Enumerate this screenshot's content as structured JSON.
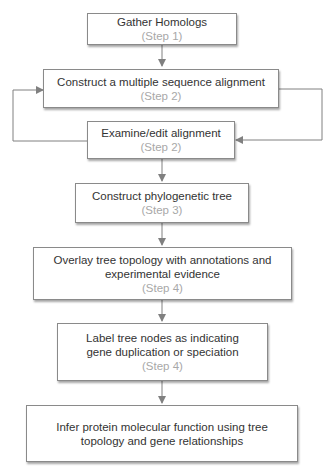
{
  "diagram": {
    "type": "flowchart",
    "colors": {
      "box_border": "#8a8a8a",
      "text": "#333333",
      "step_text": "#a8a8a8",
      "connector": "#808080"
    },
    "nodes": [
      {
        "id": "n1",
        "title": "Gather Homologs",
        "step": "(Step 1)"
      },
      {
        "id": "n2",
        "title": "Construct a multiple sequence alignment",
        "step": "(Step 2)"
      },
      {
        "id": "n3",
        "title": "Examine/edit alignment",
        "step": "(Step 2)"
      },
      {
        "id": "n4",
        "title": "Construct phylogenetic tree",
        "step": "(Step 3)"
      },
      {
        "id": "n5",
        "title": "Overlay tree topology with annotations and experimental evidence",
        "step": "(Step 4)"
      },
      {
        "id": "n6",
        "title": "Label tree nodes as indicating gene duplication or speciation",
        "step": "(Step 4)"
      },
      {
        "id": "n7",
        "title": "Infer protein molecular function using tree topology and gene relationships",
        "step": ""
      }
    ],
    "edges": [
      {
        "from": "n1",
        "to": "n2"
      },
      {
        "from": "n2",
        "to": "n3",
        "route": "right-loop"
      },
      {
        "from": "n3",
        "to": "n2",
        "route": "left-loop"
      },
      {
        "from": "n3",
        "to": "n4"
      },
      {
        "from": "n4",
        "to": "n5"
      },
      {
        "from": "n5",
        "to": "n6"
      },
      {
        "from": "n6",
        "to": "n7"
      }
    ]
  }
}
